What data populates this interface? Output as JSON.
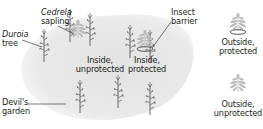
{
  "diagram": {
    "type": "field experiment schematic",
    "colors": {
      "garden_fill": "#e6e6e7",
      "duroia_stroke": "#58595b",
      "cedrela_fill": "#b9babb",
      "barrier_stroke": "#58595b",
      "text": "#231f20",
      "leader_line": "#231f20"
    },
    "region": {
      "name": "Devil's garden",
      "label_lines": [
        "Devil's",
        "garden"
      ]
    },
    "callouts": {
      "duroia": {
        "lines": [
          "Duroia",
          "tree"
        ],
        "italic_line": 0
      },
      "cedrela": {
        "lines": [
          "Cedrela",
          "sapling"
        ],
        "italic_line": 0
      },
      "barrier": {
        "lines": [
          "Insect",
          "barrier"
        ]
      },
      "devils_garden": {
        "lines": [
          "Devil's",
          "garden"
        ]
      }
    },
    "treatments": [
      {
        "id": "inside-unprotected",
        "lines": [
          "Inside,",
          "unprotected"
        ],
        "location": "inside",
        "barrier": false
      },
      {
        "id": "inside-protected",
        "lines": [
          "Inside,",
          "protected"
        ],
        "location": "inside",
        "barrier": true
      },
      {
        "id": "outside-protected",
        "lines": [
          "Outside,",
          "protected"
        ],
        "location": "outside",
        "barrier": true
      },
      {
        "id": "outside-unprotected",
        "lines": [
          "Outside,",
          "unprotected"
        ],
        "location": "outside",
        "barrier": false
      }
    ],
    "duroia_tree_count": 8,
    "cedrela_sapling_count": 4
  }
}
